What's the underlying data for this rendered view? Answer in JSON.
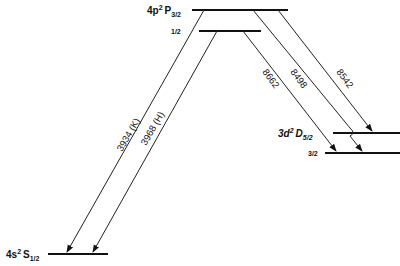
{
  "diagram": {
    "type": "energy-level-diagram",
    "levels": [
      {
        "id": "4p2P3/2",
        "label": "4p",
        "sup": "2",
        "term": "P",
        "sub": "3/2"
      },
      {
        "id": "4p2P1/2",
        "label": "1/2"
      },
      {
        "id": "3d2D5/2",
        "label": "3d",
        "sup": "2",
        "term": "D",
        "sub": "5/2"
      },
      {
        "id": "3d2D3/2",
        "label": "3/2"
      },
      {
        "id": "4s2S1/2",
        "label": "4s",
        "sup": "2",
        "term": "S",
        "sub": "1/2"
      }
    ],
    "transitions": [
      {
        "label": "3934 (K)",
        "from": "4p2P3/2",
        "to": "4s2S1/2"
      },
      {
        "label": "3968 (H)",
        "from": "4p2P1/2",
        "to": "4s2S1/2"
      },
      {
        "label": "8662",
        "from": "4p2P1/2",
        "to": "3d2D3/2"
      },
      {
        "label": "8498",
        "from": "4p2P3/2",
        "to": "3d2D3/2"
      },
      {
        "label": "8542",
        "from": "4p2P3/2",
        "to": "3d2D5/2"
      }
    ],
    "colors": {
      "line": "#111111",
      "background": "#ffffff"
    }
  }
}
